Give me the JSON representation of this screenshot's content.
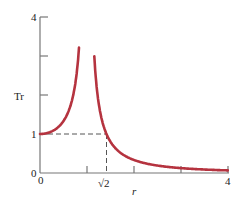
{
  "chart_data": {
    "type": "line",
    "title": "",
    "xlabel": "r",
    "ylabel": "Tr",
    "xlim": [
      0,
      4
    ],
    "ylim": [
      0,
      4
    ],
    "x_ticks": [
      0,
      1,
      1.414,
      2,
      3,
      4
    ],
    "x_tick_labels": [
      "0",
      "",
      "√2",
      "",
      "",
      "4"
    ],
    "y_ticks": [
      0,
      1,
      2,
      3,
      4
    ],
    "y_tick_labels": [
      "0",
      "1",
      "",
      "",
      "4"
    ],
    "grid": false,
    "legend": null,
    "series": [
      {
        "name": "Tr = 1/|1 - r²|",
        "color": "#b5333f",
        "x": [
          0,
          0.2,
          0.4,
          0.6,
          0.7,
          0.8,
          0.83,
          1.15,
          1.2,
          1.3,
          1.414,
          1.6,
          1.8,
          2.0,
          2.5,
          3.0,
          3.5,
          4.0
        ],
        "y": [
          1.0,
          1.04,
          1.19,
          1.56,
          1.96,
          2.78,
          3.2,
          3.1,
          2.27,
          1.45,
          1.0,
          0.64,
          0.45,
          0.33,
          0.19,
          0.125,
          0.089,
          0.067
        ]
      }
    ],
    "annotations": [
      {
        "type": "dashed-line",
        "from": [
          0,
          1
        ],
        "to": [
          1.414,
          1
        ],
        "label": ""
      },
      {
        "type": "dashed-line",
        "from": [
          1.414,
          0
        ],
        "to": [
          1.414,
          1
        ],
        "label": ""
      }
    ]
  },
  "labels": {
    "y_axis": "Tr",
    "x_axis": "r",
    "y_tick_4": "4",
    "y_tick_1": "1",
    "y_tick_0": "0",
    "x_tick_0": "0",
    "x_tick_sqrt2": "√2",
    "x_tick_4": "4"
  },
  "colors": {
    "curve": "#b5333f",
    "axis": "#777777",
    "dashed": "#555555"
  }
}
